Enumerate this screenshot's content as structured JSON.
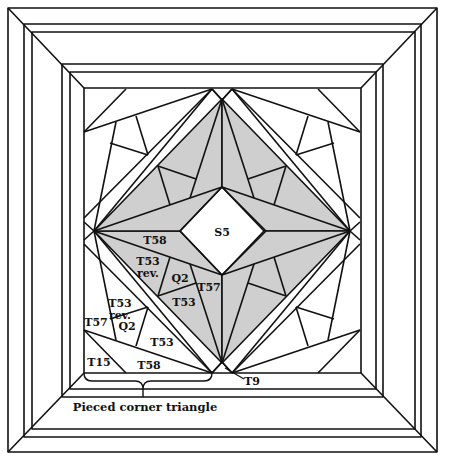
{
  "diagram": {
    "type": "quilt-block-assembly",
    "colors": {
      "line": "#111111",
      "shaded": "#cfcfcf",
      "background": "#ffffff"
    },
    "center_label": "S5",
    "shaded_unit_labels": {
      "t58": "T58",
      "t53rev_1": "T53",
      "t53rev_2": "rev.",
      "q2": "Q2",
      "t57": "T57",
      "t53": "T53"
    },
    "corner_triangle_labels": {
      "t53rev_1": "T53",
      "t53rev_2": "rev.",
      "t57": "T57",
      "q2": "Q2",
      "t53": "T53",
      "t15": "T15",
      "t58": "T58"
    },
    "tip_label": "T9",
    "caption": "Pieced corner triangle",
    "borders": 5
  }
}
